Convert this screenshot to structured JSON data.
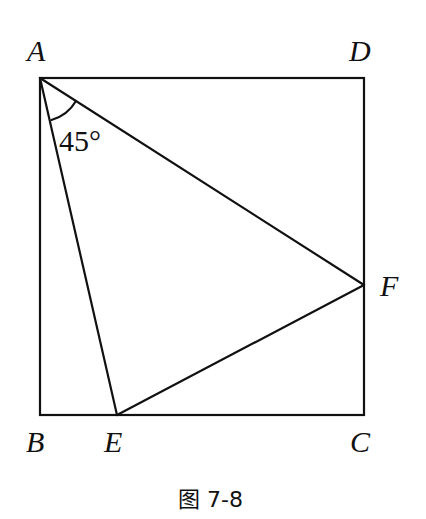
{
  "figure": {
    "caption": "图 7-8",
    "angle_label": "45°",
    "points": {
      "A": {
        "label": "A",
        "x": 40,
        "y": 78
      },
      "B": {
        "label": "B",
        "x": 40,
        "y": 415
      },
      "C": {
        "label": "C",
        "x": 364,
        "y": 415
      },
      "D": {
        "label": "D",
        "x": 364,
        "y": 78
      },
      "E": {
        "label": "E",
        "x": 117,
        "y": 415
      },
      "F": {
        "label": "F",
        "x": 364,
        "y": 285
      }
    },
    "segments": [
      "AB",
      "BC",
      "CD",
      "DA",
      "AE",
      "AF",
      "EF"
    ],
    "colors": {
      "line": "#111111",
      "background": "#ffffff"
    }
  }
}
